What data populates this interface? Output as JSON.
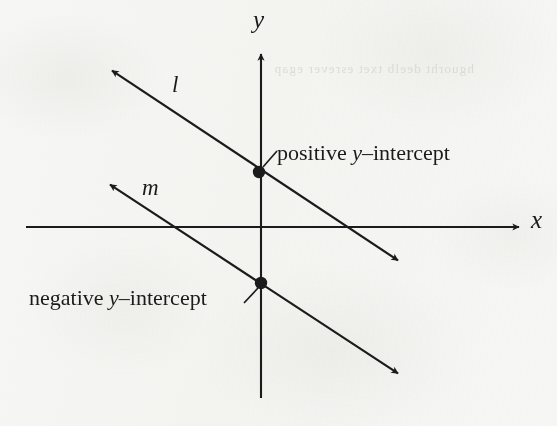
{
  "figure": {
    "kind": "coordinate-plane-diagram",
    "background_color": "#f6f6f4",
    "ink_color": "#1b1b1b"
  },
  "axes": {
    "x_label": "x",
    "y_label": "y",
    "x_axis": {
      "y": 227,
      "x_start": 26,
      "x_end": 525,
      "arrow": "right"
    },
    "y_axis": {
      "x": 261,
      "y_start": 48,
      "y_end": 398,
      "arrow": "up"
    },
    "origin": {
      "x": 261,
      "y": 227
    }
  },
  "lines": [
    {
      "name": "l",
      "label": "l",
      "from": {
        "x": 105,
        "y": 66
      },
      "to": {
        "x": 405,
        "y": 265
      },
      "arrows": "both",
      "slope": -0.66,
      "y_intercept_sign": "positive",
      "y_intercept_point": {
        "x": 259,
        "y": 172
      },
      "label_pos": {
        "x": 178,
        "y": 90
      }
    },
    {
      "name": "m",
      "label": "m",
      "from": {
        "x": 103,
        "y": 180
      },
      "to": {
        "x": 405,
        "y": 378
      },
      "arrows": "both",
      "slope": -0.66,
      "y_intercept_sign": "negative",
      "y_intercept_point": {
        "x": 261,
        "y": 283
      },
      "label_pos": {
        "x": 150,
        "y": 194
      }
    }
  ],
  "callouts": [
    {
      "id": "positive",
      "text_before": "positive ",
      "variable": "y",
      "text_after": "–intercept",
      "full_text": "positive y–intercept",
      "anchor_point": {
        "x": 259,
        "y": 172
      },
      "leader_from": {
        "x": 264,
        "y": 167
      },
      "leader_to": {
        "x": 277,
        "y": 152
      }
    },
    {
      "id": "negative",
      "text_before": "negative ",
      "variable": "y",
      "text_after": "–intercept",
      "full_text": "negative y–intercept",
      "anchor_point": {
        "x": 261,
        "y": 283
      },
      "leader_from": {
        "x": 257,
        "y": 288
      },
      "leader_to": {
        "x": 245,
        "y": 302
      }
    }
  ],
  "intercept_dots": [
    {
      "name": "positive-y-intercept-dot",
      "x": 259,
      "y": 172,
      "r": 6
    },
    {
      "name": "negative-y-intercept-dot",
      "x": 261,
      "y": 283,
      "r": 6
    }
  ],
  "bleed_through_text": "hguorht deelb txet esrever egap"
}
